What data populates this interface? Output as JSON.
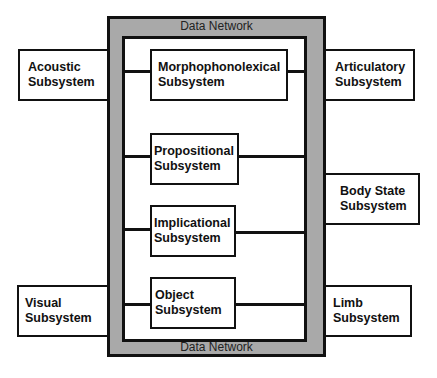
{
  "network": {
    "top_label": "Data Network",
    "bottom_label": "Data Network"
  },
  "subsystems": {
    "acoustic": "Acoustic Subsystem",
    "articulatory": "Articulatory Subsystem",
    "morphophonolexical": "Morphophonolexical Subsystem",
    "propositional": "Propositional Subsystem",
    "implicational": "Implicational Subsystem",
    "object": "Object Subsystem",
    "body_state": "Body State Subsystem",
    "visual": "Visual Subsystem",
    "limb": "Limb Subsystem"
  },
  "labels": {
    "acoustic": [
      "Acoustic",
      "Subsystem"
    ],
    "articulatory": [
      "Articulatory",
      "Subsystem"
    ],
    "morphophonolexical": [
      "Morphophonolexical",
      "Subsystem"
    ],
    "propositional": [
      "Propositional",
      "Subsystem"
    ],
    "implicational": [
      "Implicational",
      "Subsystem"
    ],
    "object": [
      "Object",
      "Subsystem"
    ],
    "body_state": [
      "Body State",
      "Subsystem"
    ],
    "visual": [
      "Visual",
      "Subsystem"
    ],
    "limb": [
      "Limb",
      "Subsystem"
    ]
  },
  "colors": {
    "network_fill": "#a9a9a9",
    "border": "#111111",
    "box_fill": "#ffffff"
  }
}
